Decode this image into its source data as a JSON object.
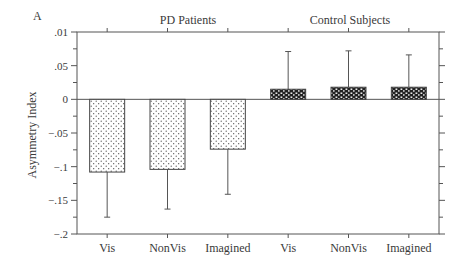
{
  "panel_label": "A",
  "chart_data": {
    "type": "bar",
    "title": "",
    "panel_label": "A",
    "group_labels": [
      "PD Patients",
      "Control Subjects"
    ],
    "categories": [
      "Vis",
      "NonVis",
      "Imagined",
      "Vis",
      "NonVis",
      "Imagined"
    ],
    "groups": [
      "PD Patients",
      "PD Patients",
      "PD Patients",
      "Control Subjects",
      "Control Subjects",
      "Control Subjects"
    ],
    "values": [
      -0.108,
      -0.104,
      -0.074,
      0.015,
      0.018,
      0.018
    ],
    "error_bar_ends": [
      -0.175,
      -0.163,
      -0.141,
      0.071,
      0.072,
      0.066
    ],
    "xlabel": "",
    "ylabel": "Asymmetry Index",
    "ylim": [
      -0.2,
      0.1
    ],
    "yticks": [
      0.1,
      0.05,
      0,
      -0.05,
      -0.1,
      -0.15,
      -0.2
    ],
    "ytick_labels": [
      ".01",
      ".05",
      "0",
      "-.05",
      "-.1",
      "-.15",
      "-.2"
    ],
    "grid": false,
    "legend": null,
    "fill_patterns": {
      "PD Patients": "light-stipple",
      "Control Subjects": "dense-checker"
    }
  }
}
